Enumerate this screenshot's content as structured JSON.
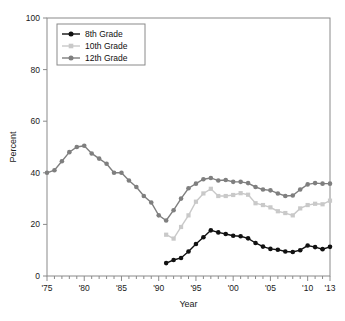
{
  "figure": {
    "name": "grade-level-percent-trend-chart",
    "background": "#ffffff"
  },
  "chart_data": {
    "type": "line",
    "title": "",
    "xlabel": "Year",
    "ylabel": "Percent",
    "xlim": [
      1975,
      2013
    ],
    "ylim": [
      0,
      100
    ],
    "grid": false,
    "legend_position": "top-left",
    "y_ticks": [
      0,
      20,
      40,
      60,
      80,
      100
    ],
    "y_tick_labels": [
      "0",
      "20",
      "40",
      "60",
      "80",
      "100"
    ],
    "x_ticks": [
      1975,
      1980,
      1985,
      1990,
      1995,
      2000,
      2005,
      2010,
      2013
    ],
    "x_tick_labels": [
      "'75",
      "'80",
      "'85",
      "'90",
      "'95",
      "'00",
      "'05",
      "'10",
      "'13"
    ],
    "x_minor_tick_interval": 1,
    "series": [
      {
        "name": "8th Grade",
        "color": "#111111",
        "marker": "circle",
        "x": [
          1991,
          1992,
          1993,
          1994,
          1995,
          1996,
          1997,
          1998,
          1999,
          2000,
          2001,
          2002,
          2003,
          2004,
          2005,
          2006,
          2007,
          2008,
          2009,
          2010,
          2011,
          2012,
          2013
        ],
        "values": [
          5.0,
          6.2,
          7.0,
          9.5,
          12.4,
          15.0,
          17.7,
          16.9,
          16.3,
          15.6,
          15.4,
          14.6,
          12.8,
          11.4,
          10.5,
          10.2,
          9.5,
          9.3,
          10.0,
          11.8,
          11.2,
          10.4,
          11.3
        ]
      },
      {
        "name": "10th Grade",
        "color": "#c9c9c9",
        "marker": "square",
        "x": [
          1991,
          1992,
          1993,
          1994,
          1995,
          1996,
          1997,
          1998,
          1999,
          2000,
          2001,
          2002,
          2003,
          2004,
          2005,
          2006,
          2007,
          2008,
          2009,
          2010,
          2011,
          2012,
          2013
        ],
        "values": [
          16.0,
          14.5,
          19.0,
          23.5,
          28.8,
          32.0,
          33.8,
          31.0,
          31.0,
          31.4,
          32.1,
          31.5,
          28.2,
          27.5,
          26.6,
          25.1,
          24.4,
          23.5,
          26.2,
          27.5,
          28.0,
          27.8,
          29.2
        ]
      },
      {
        "name": "12th Grade",
        "color": "#7f7f7f",
        "marker": "circle",
        "x": [
          1975,
          1976,
          1977,
          1978,
          1979,
          1980,
          1981,
          1982,
          1983,
          1984,
          1985,
          1986,
          1987,
          1988,
          1989,
          1990,
          1991,
          1992,
          1993,
          1994,
          1995,
          1996,
          1997,
          1998,
          1999,
          2000,
          2001,
          2002,
          2003,
          2004,
          2005,
          2006,
          2007,
          2008,
          2009,
          2010,
          2011,
          2012,
          2013
        ],
        "values": [
          40.0,
          41.0,
          44.5,
          48.0,
          50.0,
          50.5,
          47.5,
          45.5,
          43.5,
          40.0,
          40.0,
          37.0,
          34.5,
          31.0,
          28.5,
          23.5,
          21.5,
          25.5,
          30.0,
          34.0,
          35.8,
          37.5,
          38.0,
          37.0,
          37.2,
          36.5,
          36.5,
          36.0,
          34.5,
          33.5,
          33.2,
          32.0,
          31.0,
          31.2,
          33.5,
          35.5,
          36.0,
          35.8,
          35.8
        ]
      }
    ]
  },
  "legend": {
    "entries": [
      {
        "label": "8th Grade"
      },
      {
        "label": "10th Grade"
      },
      {
        "label": "12th Grade"
      }
    ]
  }
}
